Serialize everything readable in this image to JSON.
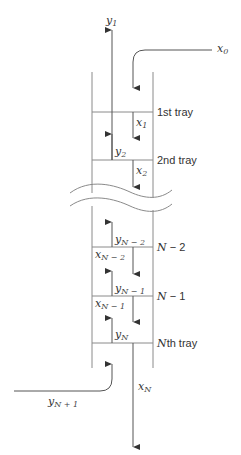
{
  "diagram": {
    "colors": {
      "line": "#555555",
      "wall": "#8a8a8a",
      "text": "#333333",
      "background": "#ffffff"
    },
    "streams": {
      "top_vapor": {
        "symbol": "y",
        "sub": "1"
      },
      "top_liquid_feed": {
        "symbol": "x",
        "sub": "0"
      },
      "bottom_vapor_feed": {
        "symbol": "y",
        "sub": "N + 1"
      },
      "bottom_liquid": {
        "symbol": "x",
        "sub": "N"
      }
    },
    "trays": [
      {
        "label": "1st tray",
        "down_liquid": {
          "symbol": "x",
          "sub": "1"
        },
        "up_vapor": {
          "symbol": "y",
          "sub": "2"
        }
      },
      {
        "label": "2nd tray",
        "down_liquid": {
          "symbol": "x",
          "sub": "2"
        }
      },
      {
        "label_main": "N",
        "label_rest": " − 2",
        "up_vapor": {
          "symbol": "y",
          "sub": "N − 2"
        },
        "down_liquid": {
          "symbol": "x",
          "sub": "N − 2"
        }
      },
      {
        "label_main": "N",
        "label_rest": " − 1",
        "up_vapor": {
          "symbol": "y",
          "sub": "N − 1"
        },
        "down_liquid": {
          "symbol": "x",
          "sub": "N − 1"
        }
      },
      {
        "label_main": "N",
        "label_rest": "th tray",
        "up_vapor": {
          "symbol": "y",
          "sub": "N"
        }
      }
    ]
  }
}
